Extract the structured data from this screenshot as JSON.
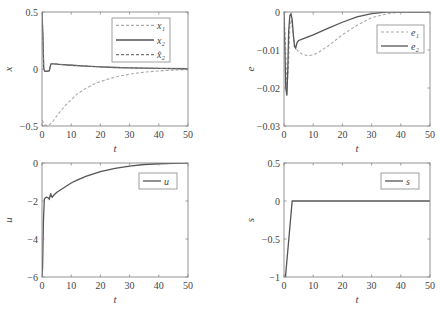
{
  "chart_data": [
    {
      "id": "x",
      "type": "line",
      "title": "",
      "xlabel": "t",
      "ylabel": "x",
      "xlim": [
        0,
        50
      ],
      "ylim": [
        -0.5,
        0.5
      ],
      "xticks": [
        0,
        10,
        20,
        30,
        40,
        50
      ],
      "yticks": [
        -0.5,
        0,
        0.5
      ],
      "ytick_labels": [
        "-0.5",
        "0",
        "0.5"
      ],
      "grid": false,
      "legend_position": "upper right",
      "box": {
        "x": 42,
        "y": 12,
        "w": 146,
        "h": 114
      },
      "legend": {
        "x": 112,
        "y": 18,
        "w": 58,
        "h": 44
      },
      "series": [
        {
          "name": "x₁",
          "legend_label": "x1",
          "style": "dashed",
          "color": "#aaaaaa",
          "x": [
            0,
            0.5,
            1,
            2,
            3,
            4,
            6,
            8,
            10,
            12,
            15,
            18,
            20,
            25,
            30,
            35,
            40,
            45,
            50
          ],
          "y": [
            -0.45,
            -0.47,
            -0.49,
            -0.5,
            -0.48,
            -0.45,
            -0.38,
            -0.32,
            -0.27,
            -0.22,
            -0.17,
            -0.13,
            -0.11,
            -0.07,
            -0.045,
            -0.028,
            -0.017,
            -0.01,
            -0.006
          ]
        },
        {
          "name": "x₂",
          "legend_label": "x2",
          "style": "solid",
          "color": "#555555",
          "x": [
            0,
            0.3,
            0.6,
            1,
            2,
            2.5,
            3,
            3.2,
            4,
            6,
            10,
            15,
            20,
            25,
            30,
            40,
            50
          ],
          "y": [
            0.5,
            0.3,
            0.0,
            -0.02,
            -0.02,
            -0.015,
            0.04,
            0.045,
            0.045,
            0.04,
            0.033,
            0.025,
            0.018,
            0.013,
            0.01,
            0.005,
            0.002
          ]
        },
        {
          "name": "x̂₂",
          "legend_label": "x2hat",
          "style": "dashed",
          "color": "#777777",
          "x": [
            0,
            0.3,
            0.6,
            1,
            2,
            2.5,
            3,
            3.2,
            4,
            6,
            10,
            15,
            20,
            25,
            30,
            40,
            50
          ],
          "y": [
            0.5,
            0.28,
            0.0,
            -0.018,
            -0.018,
            -0.013,
            0.042,
            0.047,
            0.046,
            0.041,
            0.034,
            0.026,
            0.019,
            0.014,
            0.011,
            0.005,
            0.002
          ]
        }
      ]
    },
    {
      "id": "e",
      "type": "line",
      "title": "",
      "xlabel": "t",
      "ylabel": "e",
      "xlim": [
        0,
        50
      ],
      "ylim": [
        -0.03,
        0
      ],
      "xticks": [
        0,
        10,
        20,
        30,
        40,
        50
      ],
      "yticks": [
        -0.03,
        -0.02,
        -0.01,
        0
      ],
      "ytick_labels": [
        "-0.03",
        "-0.02",
        "-0.01",
        "0"
      ],
      "grid": false,
      "legend_position": "upper right",
      "box": {
        "x": 284,
        "y": 12,
        "w": 146,
        "h": 114
      },
      "legend": {
        "x": 377,
        "y": 25,
        "w": 47,
        "h": 28
      },
      "series": [
        {
          "name": "e₁",
          "legend_label": "e1",
          "style": "dashed",
          "color": "#aaaaaa",
          "x": [
            0,
            0.5,
            1,
            1.5,
            2,
            2.5,
            3,
            3.5,
            4,
            5,
            6,
            8,
            10,
            12,
            15,
            20,
            25,
            30,
            35,
            40,
            45,
            50
          ],
          "y": [
            0,
            -0.008,
            -0.02,
            -0.015,
            -0.004,
            -0.002,
            -0.005,
            -0.008,
            -0.0095,
            -0.0105,
            -0.011,
            -0.0115,
            -0.0113,
            -0.0105,
            -0.009,
            -0.006,
            -0.0035,
            -0.0015,
            -0.0005,
            0,
            0,
            0
          ]
        },
        {
          "name": "e₂",
          "legend_label": "e2",
          "style": "solid",
          "color": "#555555",
          "x": [
            0,
            0.3,
            0.6,
            1,
            1.3,
            1.6,
            2,
            2.4,
            2.8,
            3.2,
            3.6,
            4,
            4.5,
            5,
            6,
            8,
            10,
            15,
            20,
            25,
            30,
            35,
            40,
            45,
            50
          ],
          "y": [
            0,
            -0.01,
            -0.02,
            -0.022,
            -0.015,
            -0.005,
            -0.001,
            -0.0005,
            -0.002,
            -0.006,
            -0.009,
            -0.0095,
            -0.008,
            -0.0075,
            -0.0072,
            -0.0066,
            -0.006,
            -0.0043,
            -0.0027,
            -0.0013,
            -0.0004,
            0,
            0,
            0,
            0
          ]
        }
      ]
    },
    {
      "id": "u",
      "type": "line",
      "title": "",
      "xlabel": "t",
      "ylabel": "u",
      "xlim": [
        0,
        50
      ],
      "ylim": [
        -6,
        0
      ],
      "xticks": [
        0,
        10,
        20,
        30,
        40,
        50
      ],
      "yticks": [
        -6,
        -4,
        -2,
        0
      ],
      "ytick_labels": [
        "-6",
        "-4",
        "-2",
        "0"
      ],
      "grid": false,
      "legend_position": "upper right",
      "box": {
        "x": 42,
        "y": 163,
        "w": 146,
        "h": 114
      },
      "legend": {
        "x": 139,
        "y": 173,
        "w": 38,
        "h": 16
      },
      "series": [
        {
          "name": "u",
          "legend_label": "u",
          "style": "solid",
          "color": "#555555",
          "x": [
            0,
            0.2,
            0.5,
            0.8,
            1,
            1.5,
            2,
            2.5,
            3,
            3.2,
            3.5,
            4,
            5,
            6,
            8,
            10,
            12,
            15,
            20,
            25,
            30,
            35,
            40,
            45,
            50
          ],
          "y": [
            -6,
            -5.5,
            -3,
            -1.9,
            -1.85,
            -1.8,
            -1.82,
            -1.9,
            -1.6,
            -1.75,
            -1.8,
            -1.7,
            -1.55,
            -1.45,
            -1.25,
            -1.05,
            -0.9,
            -0.7,
            -0.45,
            -0.28,
            -0.16,
            -0.08,
            -0.04,
            -0.015,
            0
          ]
        }
      ]
    },
    {
      "id": "s",
      "type": "line",
      "title": "",
      "xlabel": "t",
      "ylabel": "s",
      "xlim": [
        0,
        50
      ],
      "ylim": [
        -1,
        0.5
      ],
      "xticks": [
        0,
        10,
        20,
        30,
        40,
        50
      ],
      "yticks": [
        -1,
        -0.5,
        0,
        0.5
      ],
      "ytick_labels": [
        "-1",
        "-0.5",
        "0",
        "0.5"
      ],
      "grid": false,
      "legend_position": "upper right",
      "box": {
        "x": 284,
        "y": 163,
        "w": 146,
        "h": 114
      },
      "legend": {
        "x": 381,
        "y": 173,
        "w": 38,
        "h": 16
      },
      "series": [
        {
          "name": "s",
          "legend_label": "s",
          "style": "solid",
          "color": "#555555",
          "x": [
            0,
            0.5,
            2.8,
            10,
            20,
            30,
            40,
            50
          ],
          "y": [
            -1,
            -1,
            0,
            0,
            0,
            0,
            0,
            0
          ]
        }
      ]
    }
  ],
  "figure": {
    "panels": [
      {
        "ylabel": "x",
        "xlabel": "t",
        "legend": [
          "x1",
          "x2",
          "x̂2"
        ]
      },
      {
        "ylabel": "e",
        "xlabel": "t",
        "legend": [
          "e1",
          "e2"
        ]
      },
      {
        "ylabel": "u",
        "xlabel": "t",
        "legend": [
          "u"
        ]
      },
      {
        "ylabel": "s",
        "xlabel": "t",
        "legend": [
          "s"
        ]
      }
    ]
  }
}
